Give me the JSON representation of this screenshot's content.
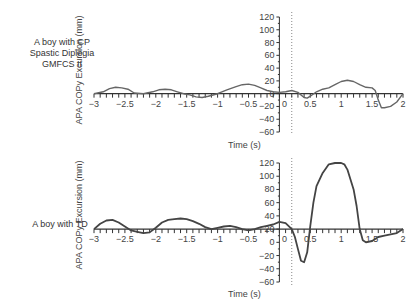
{
  "chart_data": [
    {
      "type": "line",
      "panel_label": [
        "A boy with CP",
        "Spastic Diplegia",
        "GMFCS II"
      ],
      "xlabel": "Time (s)",
      "ylabel": "APA COPy Excursion (mm)",
      "xlim": [
        -3,
        2
      ],
      "ylim": [
        -60,
        120
      ],
      "x_ticks": [
        -3,
        -2.5,
        -2,
        -1.5,
        -1,
        -0.5,
        0,
        0.5,
        1,
        1.5,
        2
      ],
      "y_ticks": [
        120,
        100,
        80,
        60,
        40,
        20,
        0,
        -20,
        -40,
        -60
      ],
      "x_axis_crosses_y": 0,
      "reference_line_x": 0.2,
      "grid": false,
      "series": [
        {
          "name": "COPy",
          "x": [
            -3,
            -2.85,
            -2.75,
            -2.65,
            -2.55,
            -2.45,
            -2.35,
            -2.2,
            -2.05,
            -1.95,
            -1.85,
            -1.75,
            -1.65,
            -1.55,
            -1.45,
            -1.35,
            -1.25,
            -1.15,
            -1.0,
            -0.85,
            -0.7,
            -0.6,
            -0.5,
            -0.4,
            -0.3,
            -0.2,
            -0.1,
            0,
            0.1,
            0.2,
            0.3,
            0.4,
            0.45,
            0.5,
            0.6,
            0.7,
            0.8,
            0.9,
            1.0,
            1.1,
            1.2,
            1.3,
            1.4,
            1.5,
            1.55,
            1.6,
            1.65,
            1.7,
            1.8,
            1.9,
            2.0
          ],
          "y": [
            0,
            3,
            8,
            10,
            9,
            7,
            1,
            0,
            3,
            6,
            7,
            6,
            3,
            0,
            -2,
            -5,
            -6,
            -4,
            0,
            6,
            11,
            14,
            15,
            13,
            9,
            5,
            3,
            2,
            3,
            5,
            2,
            -6,
            -7,
            -4,
            3,
            7,
            9,
            14,
            19,
            21,
            19,
            14,
            10,
            9,
            5,
            -10,
            -22,
            -22,
            -20,
            -13,
            0
          ]
        }
      ]
    },
    {
      "type": "line",
      "panel_label": [
        "A boy with TD"
      ],
      "xlabel": "Time (s)",
      "ylabel": "APA COPy Excursion (mm)",
      "xlim": [
        -3,
        2
      ],
      "ylim": [
        -60,
        120
      ],
      "x_ticks": [
        -3,
        -2.5,
        -2,
        -1.5,
        -1,
        -0.5,
        0,
        0.5,
        1,
        1.5,
        2
      ],
      "y_ticks": [
        120,
        100,
        80,
        60,
        40,
        20,
        0,
        -20,
        -40,
        -60
      ],
      "x_axis_crosses_y": 20,
      "reference_line_x": 0.2,
      "grid": false,
      "series": [
        {
          "name": "COPy",
          "x": [
            -3,
            -2.9,
            -2.8,
            -2.7,
            -2.6,
            -2.5,
            -2.4,
            -2.3,
            -2.2,
            -2.1,
            -2.0,
            -1.9,
            -1.8,
            -1.7,
            -1.6,
            -1.5,
            -1.4,
            -1.3,
            -1.2,
            -1.1,
            -1.0,
            -0.9,
            -0.8,
            -0.7,
            -0.6,
            -0.5,
            -0.4,
            -0.3,
            -0.2,
            -0.1,
            0,
            0.1,
            0.2,
            0.25,
            0.3,
            0.35,
            0.4,
            0.45,
            0.5,
            0.55,
            0.6,
            0.7,
            0.8,
            0.9,
            1.0,
            1.05,
            1.1,
            1.15,
            1.2,
            1.25,
            1.3,
            1.35,
            1.4,
            1.5,
            1.6,
            1.7,
            1.8,
            1.9,
            2.0
          ],
          "y": [
            20,
            28,
            33,
            34,
            30,
            24,
            18,
            16,
            14,
            15,
            22,
            30,
            34,
            35,
            36,
            35,
            32,
            28,
            23,
            20,
            22,
            24,
            25,
            23,
            20,
            18,
            20,
            23,
            25,
            27,
            31,
            29,
            20,
            8,
            -10,
            -28,
            -30,
            -15,
            25,
            60,
            85,
            105,
            118,
            120,
            120,
            118,
            110,
            95,
            80,
            55,
            20,
            3,
            0,
            2,
            8,
            10,
            12,
            14,
            20
          ]
        }
      ]
    }
  ]
}
